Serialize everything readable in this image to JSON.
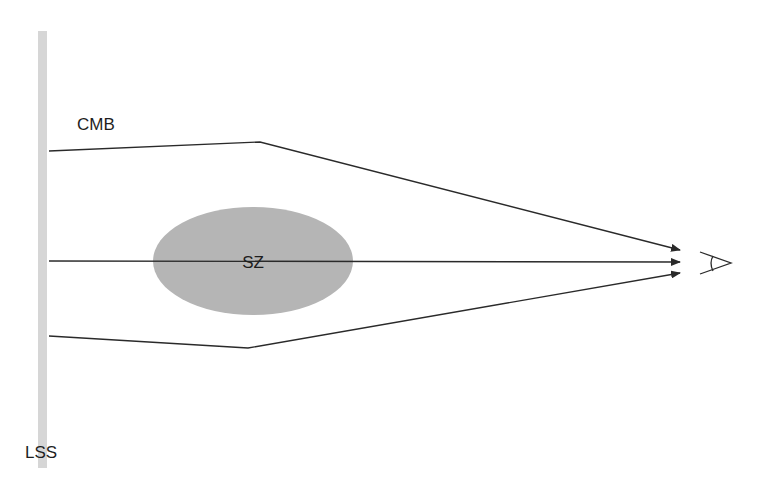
{
  "diagram": {
    "labels": {
      "cmb": "CMB",
      "sz": "SZ",
      "lss": "LSS"
    },
    "colors": {
      "lss_bar": "#d6d6d6",
      "sz_cluster": "#b5b5b5",
      "rays": "#2a2a2a",
      "text": "#1e1e1e"
    },
    "elements": {
      "lss_bar": "last-scattering-surface",
      "sz_cluster": "galaxy-cluster-ellipse",
      "observer": "eye-icon",
      "rays": [
        "upper-lensed-ray",
        "central-ray",
        "lower-lensed-ray"
      ]
    }
  }
}
